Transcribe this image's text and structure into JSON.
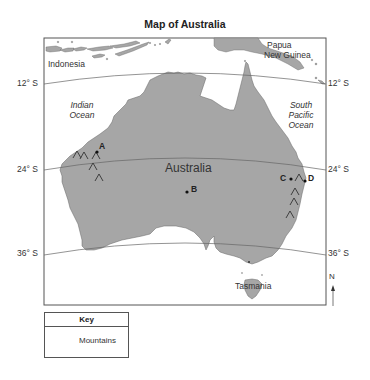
{
  "title": "Map of Australia",
  "latitudes": {
    "lat12_left": "12° S",
    "lat12_right": "12° S",
    "lat24_left": "24° S",
    "lat24_right": "24° S",
    "lat36_left": "36° S",
    "lat36_right": "36° S"
  },
  "regions": {
    "indonesia": "Indonesia",
    "papua_line1": "Papua",
    "papua_line2": "New Guinea",
    "australia": "Australia",
    "tasmania": "Tasmania"
  },
  "oceans": {
    "indian_line1": "Indian",
    "indian_line2": "Ocean",
    "pacific_line1": "South",
    "pacific_line2": "Pacific",
    "pacific_line3": "Ocean"
  },
  "points": {
    "a": "A",
    "b": "B",
    "c": "C",
    "d": "D"
  },
  "compass": {
    "north": "N"
  },
  "key": {
    "heading": "Key",
    "mountains_label": "Mountains",
    "mountains_icon": "mountain-symbol"
  },
  "colors": {
    "land": "#a6a6a6",
    "frame": "#555555",
    "latitude_line": "#666666"
  }
}
